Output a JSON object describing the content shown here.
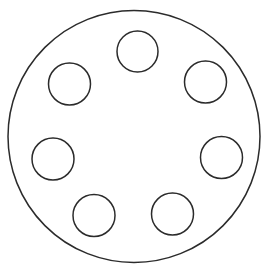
{
  "canvas": {
    "width": 261,
    "height": 272,
    "background": "#ffffff"
  },
  "stroke_color": "#2b2b2b",
  "outer_circle": {
    "cx": 134,
    "cy": 136.5,
    "r": 126
  },
  "inner_circles": [
    {
      "id": "top",
      "cx": 137.5,
      "cy": 51.5,
      "r": 20.5
    },
    {
      "id": "upper-right",
      "cx": 205.5,
      "cy": 82,
      "r": 21
    },
    {
      "id": "right",
      "cx": 221.5,
      "cy": 157.5,
      "r": 21
    },
    {
      "id": "lower-right",
      "cx": 172.5,
      "cy": 214,
      "r": 21
    },
    {
      "id": "lower-left",
      "cx": 94,
      "cy": 215.5,
      "r": 21
    },
    {
      "id": "left",
      "cx": 53,
      "cy": 159,
      "r": 21
    },
    {
      "id": "upper-left",
      "cx": 69.5,
      "cy": 84,
      "r": 21
    }
  ],
  "inner_circle_count": 7
}
